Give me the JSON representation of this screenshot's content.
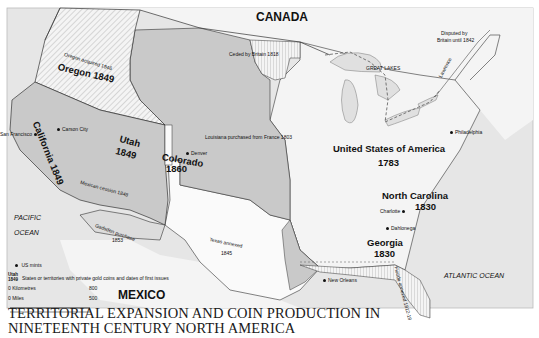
{
  "title": {
    "line1": "TERRITORIAL EXPANSION AND COIN PRODUCTION IN",
    "line2": "NINETEENTH CENTURY NORTH AMERICA"
  },
  "countries": {
    "canada": "CANADA",
    "mexico": "MEXICO"
  },
  "oceans": {
    "pacific_1": "PACIFIC",
    "pacific_2": "OCEAN",
    "atlantic": "ATLANTIC OCEAN"
  },
  "regions": {
    "oregon": {
      "name": "Oregon 1849",
      "note": "Oregon acquired 1846"
    },
    "california": {
      "name": "California 1849"
    },
    "utah": {
      "name": "Utah",
      "year": "1849"
    },
    "colorado": {
      "name": "Colorado",
      "year": "1860"
    },
    "usa": {
      "name": "United States of America",
      "year": "1783"
    },
    "north_carolina": {
      "name": "North Carolina",
      "year": "1830"
    },
    "georgia": {
      "name": "Georgia",
      "year": "1830"
    }
  },
  "annotations": {
    "ceded": "Ceded by Britain 1818",
    "disputed_1": "Disputed by",
    "disputed_2": "Britain until 1842",
    "great_lakes": "GREAT LAKES",
    "lawrence": "Lawrence",
    "louisiana": "Louisiana  purchased  from  France  1803",
    "mexican_cession": "Mexican cession 1848",
    "gadsden_1": "Gadsden purchase",
    "gadsden_2": "1853",
    "texas_1": "Texas   annexed",
    "texas_2": "1845",
    "florida": "Florida annexed 1812-19"
  },
  "cities": [
    {
      "name": "San Francisco"
    },
    {
      "name": "Carson City"
    },
    {
      "name": "Denver"
    },
    {
      "name": "Philadelphia"
    },
    {
      "name": "Charlotte"
    },
    {
      "name": "Dahlonega"
    },
    {
      "name": "New Orleans"
    }
  ],
  "legend": {
    "mints": "US mints",
    "sample_name": "Utah",
    "sample_year": "1849",
    "states_desc": "States or territories with private gold coins and dates of first issues",
    "km_label": "0 Kilometres",
    "km_value": "800",
    "mi_label": "0 Miles",
    "mi_value": "500"
  },
  "colors": {
    "gray": "#c9c9c9",
    "light": "#f4f4f4",
    "sea": "#e6e6e6",
    "border": "#333333"
  }
}
